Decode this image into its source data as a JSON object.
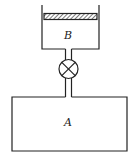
{
  "diagram": {
    "type": "physics-apparatus",
    "components": {
      "container_b": {
        "label": "B",
        "has_piston": true,
        "open_top": true
      },
      "container_a": {
        "label": "A"
      },
      "valve": {
        "symbol": "circle-with-x",
        "connects": [
          "B",
          "A"
        ]
      },
      "pipe": {
        "label": ""
      }
    },
    "colors": {
      "stroke": "#222222",
      "background": "#ffffff"
    }
  }
}
